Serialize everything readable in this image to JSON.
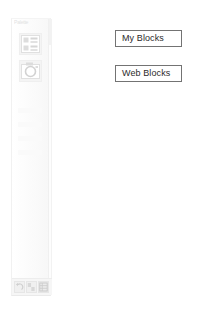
{
  "page": {
    "background_color": "#ffffff",
    "width": 204,
    "height": 310
  },
  "palette": {
    "header_label": "Palette",
    "panel_color": "#f9f9f9",
    "border_color": "#ededed",
    "tiles": [
      {
        "name": "layout-list-tile",
        "icon": "layout-list-icon",
        "label": ""
      },
      {
        "name": "camera-circle-tile",
        "icon": "camera-circle-icon",
        "label": ""
      }
    ],
    "ghost_rows": [
      "",
      "",
      "",
      ""
    ],
    "scrollbar": {
      "name": "palette-scrollbar",
      "thumb_color": "#f2f2f2"
    },
    "footer_buttons": [
      {
        "name": "footer-button-1",
        "icon": "undo-icon",
        "label": ""
      },
      {
        "name": "footer-button-2",
        "icon": "checker-icon",
        "label": ""
      },
      {
        "name": "footer-button-3",
        "icon": "grid-icon",
        "label": ""
      }
    ]
  },
  "buttons": {
    "my_blocks": {
      "label": "My Blocks",
      "border_color": "#737373",
      "text_color": "#2b2b2b",
      "background_color": "#ffffff"
    },
    "web_blocks": {
      "label": "Web Blocks",
      "border_color": "#737373",
      "text_color": "#2b2b2b",
      "background_color": "#ffffff"
    }
  }
}
